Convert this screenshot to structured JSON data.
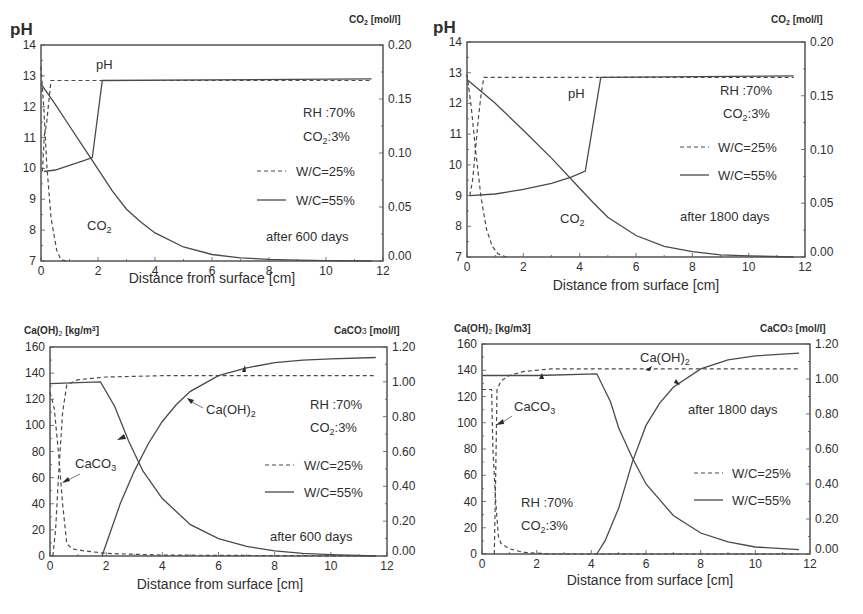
{
  "chart_data": [
    {
      "id": "ph-600",
      "type": "line",
      "title": "",
      "xlabel": "Distance from surface [cm]",
      "ylabel": "pH",
      "ylabel_right": "CO2 [mol/l]",
      "xlim": [
        0,
        12
      ],
      "ylim": [
        7,
        14
      ],
      "ylim_right": [
        0.0,
        0.2
      ],
      "xticks": [
        "0",
        "2",
        "4",
        "6",
        "8",
        "10",
        "12"
      ],
      "yticks": [
        "7",
        "8",
        "9",
        "10",
        "11",
        "12",
        "13",
        "14"
      ],
      "yticks_right": [
        "0.00",
        "0.05",
        "0.10",
        "0.15",
        "0.20"
      ],
      "grid": false,
      "annotations": [
        "pH",
        "CO2",
        "RH :70%",
        "CO2:3%",
        "after 600 days"
      ],
      "legend": [
        {
          "label": "W/C=25%",
          "style": "dashed"
        },
        {
          "label": "W/C=55%",
          "style": "solid"
        }
      ],
      "series": [
        {
          "name": "pH W/C=25%",
          "style": "dashed",
          "axis": "left",
          "x": [
            0.05,
            0.12,
            0.15,
            0.2,
            0.35,
            11.6
          ],
          "y": [
            9.9,
            11.1,
            11.2,
            11.5,
            12.85,
            12.85
          ]
        },
        {
          "name": "pH W/C=55%",
          "style": "solid",
          "axis": "left",
          "x": [
            0.1,
            0.5,
            1.0,
            1.5,
            1.8,
            2.15,
            11.6
          ],
          "y": [
            9.9,
            9.95,
            10.1,
            10.25,
            10.35,
            12.85,
            12.9
          ]
        },
        {
          "name": "CO2 W/C=25%",
          "style": "dashed",
          "axis": "right",
          "x": [
            0.0,
            0.1,
            0.2,
            0.35,
            0.55,
            0.7,
            0.9
          ],
          "y": [
            0.18,
            0.14,
            0.09,
            0.04,
            0.01,
            0.001,
            0.0
          ]
        },
        {
          "name": "CO2 W/C=55%",
          "style": "solid",
          "axis": "right",
          "x": [
            0.0,
            0.5,
            1.0,
            1.5,
            2.0,
            2.5,
            3.0,
            3.5,
            4.0,
            5.0,
            6.0,
            7.0,
            8.0,
            9.0,
            10.0,
            11.6
          ],
          "y": [
            0.164,
            0.145,
            0.125,
            0.105,
            0.085,
            0.065,
            0.048,
            0.036,
            0.026,
            0.013,
            0.006,
            0.003,
            0.0015,
            0.0008,
            0.0004,
            0.0
          ]
        }
      ]
    },
    {
      "id": "ph-1800",
      "type": "line",
      "title": "",
      "xlabel": "Distance from surface [cm]",
      "ylabel": "pH",
      "ylabel_right": "CO2 [mol/l]",
      "xlim": [
        0,
        12
      ],
      "ylim": [
        7,
        14
      ],
      "ylim_right": [
        0.0,
        0.2
      ],
      "xticks": [
        "0",
        "2",
        "4",
        "6",
        "8",
        "10",
        "12"
      ],
      "yticks": [
        "7",
        "8",
        "9",
        "10",
        "11",
        "12",
        "13",
        "14"
      ],
      "yticks_right": [
        "0.00",
        "0.05",
        "0.10",
        "0.15",
        "0.20"
      ],
      "grid": false,
      "annotations": [
        "pH",
        "CO2",
        "RH :70%",
        "CO2:3%",
        "after 1800 days"
      ],
      "legend": [
        {
          "label": "W/C=25%",
          "style": "dashed"
        },
        {
          "label": "W/C=55%",
          "style": "solid"
        }
      ],
      "series": [
        {
          "name": "pH W/C=25%",
          "style": "dashed",
          "axis": "left",
          "x": [
            0.1,
            0.2,
            0.3,
            0.4,
            0.5,
            0.6,
            11.6
          ],
          "y": [
            9.0,
            9.5,
            10.5,
            11.5,
            12.3,
            12.85,
            12.85
          ]
        },
        {
          "name": "pH W/C=55%",
          "style": "solid",
          "axis": "left",
          "x": [
            0.1,
            1.0,
            2.0,
            3.0,
            3.7,
            4.2,
            4.75,
            11.6
          ],
          "y": [
            9.0,
            9.05,
            9.2,
            9.4,
            9.6,
            9.8,
            12.85,
            12.9
          ]
        },
        {
          "name": "CO2 W/C=25%",
          "style": "dashed",
          "axis": "right",
          "x": [
            0.0,
            0.15,
            0.3,
            0.5,
            0.7,
            0.9,
            1.1,
            1.4
          ],
          "y": [
            0.17,
            0.14,
            0.1,
            0.055,
            0.025,
            0.01,
            0.003,
            0.0
          ]
        },
        {
          "name": "CO2 W/C=55%",
          "style": "solid",
          "axis": "right",
          "x": [
            0.0,
            1.0,
            2.0,
            3.0,
            4.0,
            4.5,
            5.0,
            6.0,
            7.0,
            8.0,
            9.0,
            10.0,
            11.6
          ],
          "y": [
            0.165,
            0.143,
            0.118,
            0.092,
            0.064,
            0.05,
            0.037,
            0.02,
            0.01,
            0.005,
            0.002,
            0.001,
            0.0
          ]
        }
      ]
    },
    {
      "id": "caoh2-600",
      "type": "line",
      "title": "",
      "xlabel": "Distance from surface [cm]",
      "ylabel": "Ca(OH)2 [kg/m3]",
      "ylabel_right": "CaCO3 [mol/l]",
      "xlim": [
        0,
        12
      ],
      "ylim": [
        0,
        160
      ],
      "ylim_right": [
        0.0,
        1.2
      ],
      "xticks": [
        "0",
        "2",
        "4",
        "6",
        "8",
        "10",
        "12"
      ],
      "yticks": [
        "0",
        "20",
        "40",
        "60",
        "80",
        "100",
        "120",
        "140",
        "160"
      ],
      "yticks_right": [
        "0.00",
        "0.20",
        "0.40",
        "0.60",
        "0.80",
        "1.00",
        "1.20"
      ],
      "grid": false,
      "annotations": [
        "CaCO3",
        "Ca(OH)2",
        "RH :70%",
        "CO2:3%",
        "after 600 days"
      ],
      "legend": [
        {
          "label": "W/C=25%",
          "style": "dashed"
        },
        {
          "label": "W/C=55%",
          "style": "solid"
        }
      ],
      "series": [
        {
          "name": "Ca(OH)2 W/C=25%",
          "style": "dashed",
          "axis": "left",
          "x": [
            0.1,
            0.2,
            0.3,
            0.45,
            0.6,
            1.0,
            2.0,
            4.0,
            11.6
          ],
          "y": [
            0,
            20,
            60,
            110,
            131,
            135,
            137,
            138,
            138
          ]
        },
        {
          "name": "Ca(OH)2 W/C=55%",
          "style": "solid",
          "axis": "left",
          "x": [
            1.85,
            2.5,
            3.0,
            3.5,
            4.0,
            4.5,
            5.0,
            6.0,
            7.0,
            8.0,
            9.0,
            10.0,
            11.6
          ],
          "y": [
            0,
            40,
            65,
            86,
            103,
            116,
            126,
            138,
            144,
            148,
            150,
            151,
            152
          ]
        },
        {
          "name": "CaCO3 W/C=25%",
          "style": "dashed",
          "axis": "right",
          "x": [
            0.0,
            0.15,
            0.3,
            0.45,
            0.6,
            0.8,
            1.2,
            2.0,
            4.0,
            11.6
          ],
          "y": [
            0.94,
            0.85,
            0.6,
            0.3,
            0.07,
            0.04,
            0.03,
            0.015,
            0.005,
            0.0
          ]
        },
        {
          "name": "CaCO3 W/C=55%",
          "style": "solid",
          "axis": "right",
          "x": [
            0.0,
            1.0,
            1.8,
            2.3,
            2.8,
            3.3,
            4.0,
            5.0,
            6.0,
            7.0,
            8.0,
            9.0,
            10.0,
            11.6
          ],
          "y": [
            0.99,
            0.995,
            1.0,
            0.86,
            0.66,
            0.49,
            0.33,
            0.18,
            0.1,
            0.055,
            0.03,
            0.015,
            0.008,
            0.0
          ]
        }
      ]
    },
    {
      "id": "caoh2-1800",
      "type": "line",
      "title": "",
      "xlabel": "Distance from surface [cm]",
      "ylabel": "Ca(OH)2 [kg/m3]",
      "ylabel_right": "CaCO3 [mol/l]",
      "xlim": [
        0,
        12
      ],
      "ylim": [
        0,
        160
      ],
      "ylim_right": [
        0.0,
        1.2
      ],
      "xticks": [
        "0",
        "2",
        "4",
        "6",
        "8",
        "10",
        "12"
      ],
      "yticks": [
        "0",
        "20",
        "40",
        "60",
        "80",
        "100",
        "120",
        "140",
        "160"
      ],
      "yticks_right": [
        "0.00",
        "0.20",
        "0.40",
        "0.60",
        "0.80",
        "1.00",
        "1.20"
      ],
      "grid": false,
      "annotations": [
        "Ca(OH)2",
        "CaCO3",
        "after 1800 days",
        "RH :70%",
        "CO2:3%"
      ],
      "legend": [
        {
          "label": "W/C=25%",
          "style": "dashed"
        },
        {
          "label": "W/C=55%",
          "style": "solid"
        }
      ],
      "series": [
        {
          "name": "Ca(OH)2 W/C=25%",
          "style": "dashed",
          "axis": "left",
          "x": [
            0.45,
            0.5,
            0.55,
            0.7,
            1.0,
            1.5,
            2.5,
            4.0,
            11.6
          ],
          "y": [
            0,
            60,
            125,
            132,
            136,
            139,
            141,
            141,
            141
          ]
        },
        {
          "name": "Ca(OH)2 W/C=55%",
          "style": "solid",
          "axis": "left",
          "x": [
            4.2,
            4.5,
            5.0,
            5.5,
            6.0,
            6.5,
            7.0,
            8.0,
            9.0,
            10.0,
            11.6
          ],
          "y": [
            0,
            10,
            35,
            70,
            98,
            115,
            127,
            141,
            148,
            151,
            153
          ]
        },
        {
          "name": "CaCO3 W/C=25%",
          "style": "dashed",
          "axis": "right",
          "x": [
            0.0,
            0.35,
            0.4,
            0.5,
            0.6,
            0.7,
            1.0,
            1.5,
            2.5,
            11.6
          ],
          "y": [
            0.94,
            0.94,
            0.6,
            0.3,
            0.1,
            0.06,
            0.03,
            0.01,
            0.0,
            0.0
          ]
        },
        {
          "name": "CaCO3 W/C=55%",
          "style": "solid",
          "axis": "right",
          "x": [
            0.0,
            2.0,
            4.2,
            4.7,
            5.0,
            5.5,
            6.0,
            7.0,
            8.0,
            9.0,
            10.0,
            11.6
          ],
          "y": [
            1.02,
            1.02,
            1.03,
            0.87,
            0.72,
            0.55,
            0.4,
            0.22,
            0.12,
            0.07,
            0.04,
            0.025
          ]
        }
      ]
    }
  ],
  "panels": {
    "p1": {
      "y_title": "pH",
      "y2_title_main": "CO",
      "y2_title_sub": "2",
      "y2_title_unit": " [mol/l]",
      "xlabel": "Distance from surface [cm]",
      "ann_ph": "pH",
      "ann_co2_main": "CO",
      "ann_co2_sub": "2",
      "rh": "RH :70%",
      "co2_main": "CO",
      "co2_sub": "2",
      "co2_val": ":3%",
      "leg1": "W/C=25%",
      "leg2": "W/C=55%",
      "days": "after 600 days"
    },
    "p2": {
      "y_title": "pH",
      "y2_title_main": "CO",
      "y2_title_sub": "2",
      "y2_title_unit": " [mol/l]",
      "xlabel": "Distance from surface [cm]",
      "ann_ph": "pH",
      "ann_co2_main": "CO",
      "ann_co2_sub": "2",
      "rh": "RH :70%",
      "co2_main": "CO",
      "co2_sub": "2",
      "co2_val": ":3%",
      "leg1": "W/C=25%",
      "leg2": "W/C=55%",
      "days": "after 1800 days"
    },
    "p3": {
      "y_title_main": "Ca(OH)",
      "y_title_sub": "2",
      "y_title_unit": " [kg/m",
      "y_title_sup": "3",
      "y_title_end": "]",
      "y2_title_main": "CaCO",
      "y2_title_sub": "3",
      "y2_title_unit": " [mol/l]",
      "xlabel": "Distance from surface [cm]",
      "ann_caco3_main": "CaCO",
      "ann_caco3_sub": "3",
      "ann_caoh_main": "Ca(OH)",
      "ann_caoh_sub": "2",
      "rh": "RH :70%",
      "co2_main": "CO",
      "co2_sub": "2",
      "co2_val": ":3%",
      "leg1": "W/C=25%",
      "leg2": "W/C=55%",
      "days": "after 600 days"
    },
    "p4": {
      "y_title_main": "Ca(OH)",
      "y_title_sub": "2",
      "y_title_unit": " [kg/m3]",
      "y2_title_main": "CaCO",
      "y2_title_sub": "3",
      "y2_title_unit": " [mol/l]",
      "xlabel": "Distance from surface [cm]",
      "ann_caco3_main": "CaCO",
      "ann_caco3_sub": "3",
      "ann_caoh_main": "Ca(OH)",
      "ann_caoh_sub": "2",
      "rh": "RH :70%",
      "co2_main": "CO",
      "co2_sub": "2",
      "co2_val": ":3%",
      "leg1": "W/C=25%",
      "leg2": "W/C=55%",
      "days": "after 1800 days"
    }
  }
}
